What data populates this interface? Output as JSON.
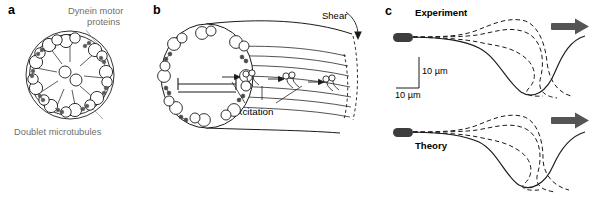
{
  "figure": {
    "caption_panels": [
      "a",
      "b",
      "c"
    ],
    "background_color": "#ffffff",
    "line_color": "#1a1a1a",
    "label_gray": "#6f6f6f",
    "arrow_gray": "#555555"
  },
  "panel_a": {
    "label": "a",
    "name": "axoneme-cross-section",
    "annotations": {
      "dynein": "Dynein motor\nproteins",
      "dynein_line1": "Dynein motor",
      "dynein_line2": "proteins",
      "doublets": "Doublet microtubules"
    },
    "structure": {
      "outer_doublets": 9,
      "central_pair": 2,
      "description": "9+2 axoneme"
    }
  },
  "panel_b": {
    "label": "b",
    "name": "cilium-shear-diagram",
    "annotations": {
      "inhibition": "Inhibition",
      "excitation": "Excitation",
      "shear": "Shear"
    },
    "structure": {
      "motor_clusters": 3,
      "sliding_arrows": 3,
      "microtubule_lines": 7
    }
  },
  "panel_c": {
    "label": "c",
    "name": "waveform-comparison",
    "plots": [
      {
        "title": "Experiment",
        "scale_bar_vertical": "10 µm",
        "scale_bar_horizontal": "10 µm",
        "solid_traces": 1,
        "dashed_traces": 3,
        "propagation_arrow": "rightward"
      },
      {
        "title": "Theory",
        "solid_traces": 1,
        "dashed_traces": 3,
        "propagation_arrow": "rightward"
      }
    ]
  }
}
